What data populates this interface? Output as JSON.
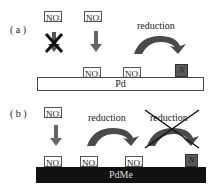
{
  "panel_a": {
    "label": "( a )",
    "top_species": [
      {
        "text": "NO",
        "sub": "3",
        "sup": "-",
        "blocked": true
      },
      {
        "text": "NO",
        "sub": "2",
        "sup": "-",
        "blocked": false
      }
    ],
    "surface_species": [
      {
        "text": "NO",
        "sub": "2",
        "sup": "-"
      },
      {
        "text": "NO",
        "sub": "2",
        "sup": "-"
      }
    ],
    "product": "N",
    "reduction_label": "reduction",
    "substrate": "Pd"
  },
  "panel_b": {
    "label": "( b )",
    "top_species": [
      {
        "text": "NO",
        "sub": "3",
        "sup": "-"
      }
    ],
    "surface_species": [
      {
        "text": "NO",
        "sub": "3",
        "sup": "-"
      },
      {
        "text": "NO",
        "sub": "3",
        "sup": "-"
      },
      {
        "text": "NO",
        "sub": "2",
        "sup": "-"
      }
    ],
    "product": "N",
    "reduction_label_1": "reduction",
    "reduction_label_2": "reduction",
    "reduction_2_crossed": true,
    "substrate": "PdMe"
  },
  "colors": {
    "arrow": "#555555",
    "product_box": "#5a5a5a",
    "substrate_b": "#111111",
    "cross": "#111111"
  }
}
